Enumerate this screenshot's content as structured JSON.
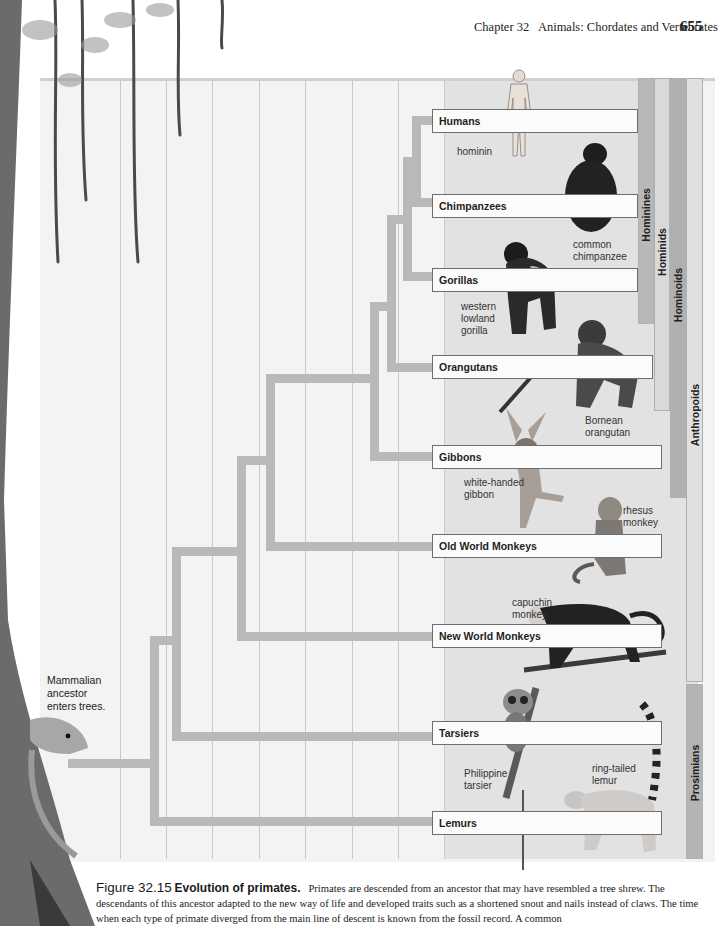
{
  "running_head": {
    "chapter": "Chapter 32   Animals: Chordates and Vertebrates",
    "page_number": "655"
  },
  "figure": {
    "taxa": [
      {
        "label": "Humans",
        "top": 109,
        "width": 206
      },
      {
        "label": "Chimpanzees",
        "top": 194,
        "width": 206
      },
      {
        "label": "Gorillas",
        "top": 268,
        "width": 206
      },
      {
        "label": "Orangutans",
        "top": 355,
        "width": 221
      },
      {
        "label": "Gibbons",
        "top": 445,
        "width": 230
      },
      {
        "label": "Old World Monkeys",
        "top": 534,
        "width": 230
      },
      {
        "label": "New World Monkeys",
        "top": 624,
        "width": 230
      },
      {
        "label": "Tarsiers",
        "top": 721,
        "width": 230
      },
      {
        "label": "Lemurs",
        "top": 811,
        "width": 230
      }
    ],
    "clades": [
      {
        "label": "Hominines",
        "left": 638,
        "top": 78,
        "width": 16,
        "height": 246,
        "color": "#b8b8b8"
      },
      {
        "label": "Hominids",
        "left": 654,
        "top": 78,
        "width": 16,
        "height": 333,
        "color": "#d9d9d9"
      },
      {
        "label": "Hominoids",
        "left": 670,
        "top": 78,
        "width": 16,
        "height": 420,
        "color": "#b0b0b0"
      },
      {
        "label": "Anthropoids",
        "left": 686,
        "top": 78,
        "width": 17,
        "height": 604,
        "color": "#dcdcdc"
      },
      {
        "label": "Prosimians",
        "left": 686,
        "top": 684,
        "width": 17,
        "height": 175,
        "color": "#b4b4b4"
      }
    ],
    "species_labels": [
      {
        "text": "hominin",
        "left": 457,
        "top": 146
      },
      {
        "text": "common\nchimpanzee",
        "left": 573,
        "top": 239
      },
      {
        "text": "western\nlowland\ngorilla",
        "left": 461,
        "top": 301
      },
      {
        "text": "Bornean\norangutan",
        "left": 585,
        "top": 415
      },
      {
        "text": "white-handed\ngibbon",
        "left": 464,
        "top": 477
      },
      {
        "text": "rhesus\nmonkey",
        "left": 623,
        "top": 505
      },
      {
        "text": "capuchin\nmonkey",
        "left": 512,
        "top": 597
      },
      {
        "text": "Philippine\ntarsier",
        "left": 464,
        "top": 768
      },
      {
        "text": "ring-tailed\nlemur",
        "left": 592,
        "top": 763
      }
    ],
    "ancestor_note": "Mammalian\nancestor\nenters trees.",
    "branch_color": "#b9b9b9"
  },
  "caption": {
    "figure_number": "Figure 32.15",
    "title": "Evolution of primates.",
    "text": "Primates are descended from an ancestor that may have resembled a tree shrew. The descendants of this ancestor adapted to the new way of life and developed traits such as a shortened snout and nails instead of claws. The time when each type of primate diverged from the main line of descent is known from the fossil record. A common"
  }
}
